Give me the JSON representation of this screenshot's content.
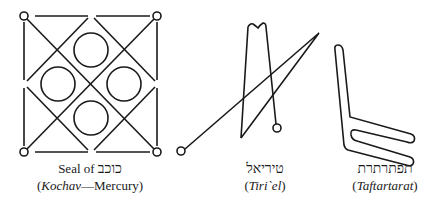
{
  "figures": [
    {
      "id": "kochav-seal",
      "caption_line1_prefix": "Seal of ",
      "caption_line1_hebrew": "כוכב",
      "caption_line2_open": "(",
      "caption_line2_italic": "Kochav",
      "caption_line2_rest": "—Mercury)"
    },
    {
      "id": "tiriel",
      "caption_line1_hebrew": "טיריאל",
      "caption_line2_open": "(",
      "caption_line2_italic": "Tiri`el",
      "caption_line2_close": ")"
    },
    {
      "id": "taftartarat",
      "caption_line1_hebrew": "תפתרתרת",
      "caption_line2_open": "(",
      "caption_line2_italic": "Taftartarat",
      "caption_line2_close": ")"
    }
  ],
  "colors": {
    "ink": "#1a1a1a",
    "background": "#ffffff"
  }
}
